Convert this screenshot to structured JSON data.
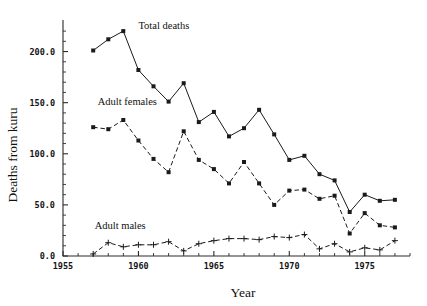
{
  "chart_data": {
    "type": "line",
    "title": "",
    "xlabel": "Year",
    "ylabel": "Deaths from kuru",
    "xlim": [
      1955,
      1978
    ],
    "ylim": [
      0,
      225
    ],
    "grid": false,
    "legend_position": "inline-annotations",
    "x_ticks": [
      "1955",
      "1960",
      "1965",
      "1970",
      "1975"
    ],
    "x_tick_values": [
      1955,
      1960,
      1965,
      1970,
      1975
    ],
    "y_ticks": [
      "0.0",
      "50.0",
      "100.0",
      "150.0",
      "200.0"
    ],
    "y_tick_values": [
      0,
      50,
      100,
      150,
      200
    ],
    "x": [
      1957,
      1958,
      1959,
      1960,
      1961,
      1962,
      1963,
      1964,
      1965,
      1966,
      1967,
      1968,
      1969,
      1970,
      1971,
      1972,
      1973,
      1974,
      1975,
      1976,
      1977
    ],
    "series": [
      {
        "name": "Total deaths",
        "marker": "square",
        "linestyle": "solid",
        "label_x": 1960.0,
        "label_y": 222,
        "values": [
          201,
          212,
          220,
          182,
          166,
          151,
          169,
          131,
          141,
          117,
          125,
          143,
          119,
          94,
          98,
          80,
          74,
          43,
          60,
          54,
          55
        ]
      },
      {
        "name": "Adult females",
        "marker": "square",
        "linestyle": "dashed",
        "label_x": 1957.3,
        "label_y": 148,
        "values": [
          126,
          124,
          133,
          113,
          95,
          82,
          122,
          94,
          85,
          71,
          92,
          71,
          50,
          64,
          65,
          56,
          59,
          22,
          42,
          30,
          28
        ]
      },
      {
        "name": "Adult males",
        "marker": "plus",
        "linestyle": "dashed",
        "label_x": 1957.1,
        "label_y": 26,
        "values": [
          2,
          13,
          9,
          11,
          11,
          14,
          5,
          12,
          15,
          17,
          17,
          16,
          19,
          18,
          21,
          7,
          12,
          4,
          8,
          6,
          15
        ]
      }
    ]
  }
}
